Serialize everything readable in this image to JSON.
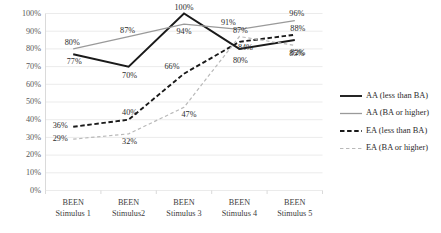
{
  "chart_data": {
    "type": "line",
    "title": "",
    "subtitle": "",
    "xlabel": "",
    "ylabel": "",
    "ylim": [
      0,
      1.0
    ],
    "grid": true,
    "legend_position": "right",
    "categories": [
      "BEEN\nStimulus 1",
      "BEEN\nStimulus2",
      "BEEN\nStimulus 3",
      "BEEN\nStimulus 4",
      "BEEN\nStimulus 5"
    ],
    "category_lines": [
      [
        "BEEN",
        "Stimulus 1"
      ],
      [
        "BEEN",
        "Stimulus2"
      ],
      [
        "BEEN",
        "Stimulus 3"
      ],
      [
        "BEEN",
        "Stimulus 4"
      ],
      [
        "BEEN",
        "Stimulus 5"
      ]
    ],
    "ytick_labels": [
      "100%",
      "90%",
      "80%",
      "70%",
      "60%",
      "50%",
      "40%",
      "30%",
      "20%",
      "10%",
      "0%"
    ],
    "ytick_values": [
      1.0,
      0.9,
      0.8,
      0.7,
      0.6,
      0.5,
      0.4,
      0.3,
      0.2,
      0.1,
      0.0
    ],
    "series": [
      {
        "name": "AA (less than BA)",
        "style": "solid",
        "color": "#1a1a1a",
        "width": 1.9,
        "values": [
          0.77,
          0.7,
          1.0,
          0.8,
          0.85
        ],
        "labels": [
          "77%",
          "70%",
          "100%",
          "80%",
          "85%"
        ]
      },
      {
        "name": "AA (BA or higher)",
        "style": "solid",
        "color": "#9a9a9a",
        "width": 1.3,
        "values": [
          0.8,
          0.87,
          0.94,
          0.91,
          0.96
        ],
        "labels": [
          "80%",
          "87%",
          "94%",
          "91%",
          "96%"
        ]
      },
      {
        "name": "EA (less than BA)",
        "style": "dashed",
        "color": "#1a1a1a",
        "width": 1.9,
        "values": [
          0.36,
          0.4,
          0.66,
          0.84,
          0.88
        ],
        "labels": [
          "36%",
          "40%",
          "66%",
          "84%",
          "88%"
        ]
      },
      {
        "name": "EA (BA or higher)",
        "style": "dashed",
        "color": "#b9b9b9",
        "width": 1.2,
        "values": [
          0.29,
          0.32,
          0.47,
          0.87,
          0.82
        ],
        "labels": [
          "29%",
          "32%",
          "47%",
          "87%",
          "82%"
        ]
      }
    ]
  },
  "legend": {
    "items": [
      {
        "label": "AA (less than BA)"
      },
      {
        "label": "AA (BA or higher)"
      },
      {
        "label": "EA (less than BA)"
      },
      {
        "label": "EA (BA or higher)"
      }
    ]
  },
  "label_offsets": [
    [
      {
        "dx": 1,
        "dy": 10
      },
      {
        "dx": 1,
        "dy": 11
      },
      {
        "dx": 0,
        "dy": -4
      },
      {
        "dx": 1,
        "dy": 14
      },
      {
        "dx": 2,
        "dy": 16
      }
    ],
    [
      {
        "dx": -1,
        "dy": -4
      },
      {
        "dx": -1,
        "dy": -4
      },
      {
        "dx": 0,
        "dy": 10
      },
      {
        "dx": -11,
        "dy": -4
      },
      {
        "dx": 2,
        "dy": -5
      }
    ],
    [
      {
        "dx": -13,
        "dy": 1
      },
      {
        "dx": 1,
        "dy": -5
      },
      {
        "dx": -12,
        "dy": -5
      },
      {
        "dx": 6,
        "dy": 8
      },
      {
        "dx": 3,
        "dy": -4
      }
    ],
    [
      {
        "dx": -13,
        "dy": 2
      },
      {
        "dx": 1,
        "dy": 10
      },
      {
        "dx": 5,
        "dy": 10
      },
      {
        "dx": 1,
        "dy": -4
      },
      {
        "dx": 3,
        "dy": 10
      }
    ]
  ]
}
